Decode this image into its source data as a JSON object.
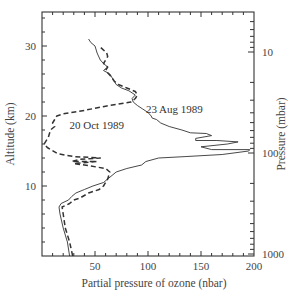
{
  "chart_data": {
    "type": "line",
    "title": "",
    "xlabel": "Partial pressure of ozone (nbar)",
    "ylabel": "Altitude (km)",
    "y2label": "Pressure (mbar)",
    "xlim": [
      0,
      200
    ],
    "ylim": [
      0,
      35
    ],
    "x_ticks": [
      50,
      100,
      150,
      200
    ],
    "y_ticks": [
      10,
      20,
      30
    ],
    "y2_ticks": [
      {
        "label": "10",
        "value": 10
      },
      {
        "label": "100",
        "value": 100
      },
      {
        "label": "1000",
        "value": 1000
      }
    ],
    "grid": false,
    "legend": null,
    "annotations": [
      {
        "text": "23 Aug 1989",
        "x": 98,
        "y": 20.5
      },
      {
        "text": "20 Oct 1989",
        "x": 26,
        "y": 18.2
      }
    ],
    "series": [
      {
        "name": "23 Aug 1989",
        "style": "solid",
        "points": [
          [
            26,
            0
          ],
          [
            24,
            2
          ],
          [
            20,
            4
          ],
          [
            17,
            6
          ],
          [
            16,
            7
          ],
          [
            18,
            7.5
          ],
          [
            25,
            8
          ],
          [
            28,
            8.5
          ],
          [
            32,
            9
          ],
          [
            40,
            9.5
          ],
          [
            48,
            10
          ],
          [
            58,
            10.5
          ],
          [
            62,
            11
          ],
          [
            70,
            12
          ],
          [
            80,
            12.5
          ],
          [
            94,
            13
          ],
          [
            98,
            13.5
          ],
          [
            110,
            14
          ],
          [
            135,
            14.2
          ],
          [
            170,
            14.5
          ],
          [
            195,
            15
          ],
          [
            196,
            15.2
          ],
          [
            160,
            15.2
          ],
          [
            150,
            15.6
          ],
          [
            175,
            16
          ],
          [
            185,
            16.3
          ],
          [
            165,
            16.5
          ],
          [
            145,
            16.5
          ],
          [
            145,
            16.8
          ],
          [
            160,
            17.2
          ],
          [
            155,
            17.5
          ],
          [
            140,
            17.6
          ],
          [
            132,
            18
          ],
          [
            120,
            18.5
          ],
          [
            112,
            19
          ],
          [
            108,
            19.5
          ],
          [
            104,
            19.7
          ],
          [
            103,
            20
          ],
          [
            100,
            20.5
          ],
          [
            95,
            21
          ],
          [
            90,
            21.5
          ],
          [
            86,
            22
          ],
          [
            85,
            22.5
          ],
          [
            88,
            23
          ],
          [
            82,
            23.6
          ],
          [
            75,
            24
          ],
          [
            70,
            24.5
          ],
          [
            68,
            25
          ],
          [
            64,
            26
          ],
          [
            58,
            26.5
          ],
          [
            62,
            27
          ],
          [
            58,
            27.5
          ],
          [
            55,
            28
          ],
          [
            52,
            29
          ],
          [
            50,
            30
          ],
          [
            46,
            30.5
          ],
          [
            44,
            31
          ]
        ]
      },
      {
        "name": "20 Oct 1989",
        "style": "dashed",
        "points": [
          [
            29,
            0
          ],
          [
            26,
            2
          ],
          [
            22,
            4
          ],
          [
            20,
            6
          ],
          [
            19,
            7
          ],
          [
            22,
            7.2
          ],
          [
            26,
            7.5
          ],
          [
            30,
            8
          ],
          [
            36,
            8.3
          ],
          [
            44,
            9
          ],
          [
            54,
            9.5
          ],
          [
            58,
            10
          ],
          [
            62,
            11
          ],
          [
            64,
            12
          ],
          [
            60,
            12.5
          ],
          [
            40,
            13
          ],
          [
            30,
            13.2
          ],
          [
            52,
            13.5
          ],
          [
            28,
            13.5
          ],
          [
            35,
            13.8
          ],
          [
            55,
            14
          ],
          [
            30,
            14.2
          ],
          [
            15,
            14.6
          ],
          [
            5,
            15.5
          ],
          [
            2,
            16
          ],
          [
            6,
            17
          ],
          [
            8,
            18
          ],
          [
            12,
            18.5
          ],
          [
            10,
            19
          ],
          [
            12,
            19.5
          ],
          [
            14,
            20
          ],
          [
            20,
            20.3
          ],
          [
            40,
            20.8
          ],
          [
            60,
            21.4
          ],
          [
            84,
            22
          ],
          [
            88,
            22.5
          ],
          [
            90,
            23
          ],
          [
            88,
            23.5
          ],
          [
            80,
            24
          ],
          [
            72,
            24.5
          ],
          [
            68,
            25
          ],
          [
            66,
            25.5
          ],
          [
            63,
            26
          ],
          [
            60,
            26.5
          ],
          [
            62,
            27
          ],
          [
            58,
            27.5
          ],
          [
            60,
            28
          ],
          [
            62,
            28.5
          ],
          [
            61,
            29
          ],
          [
            56,
            29.7
          ],
          [
            54,
            30
          ]
        ]
      }
    ]
  }
}
